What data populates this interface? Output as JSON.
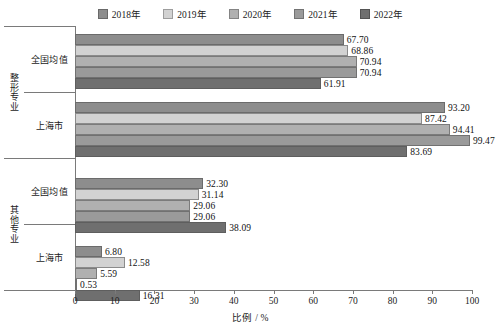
{
  "chart_data": {
    "type": "bar",
    "orientation": "horizontal",
    "title": "",
    "xlabel": "比例 / %",
    "ylabel": "",
    "xlim": [
      0,
      100
    ],
    "xticks": [
      0,
      10,
      20,
      30,
      40,
      50,
      60,
      70,
      80,
      90,
      100
    ],
    "grid": false,
    "legend_position": "top-center",
    "legend": [
      "2018年",
      "2019年",
      "2020年",
      "2021年",
      "2022年"
    ],
    "series_colors": [
      "#8d8d8d",
      "#d2d2d2",
      "#b0b0b0",
      "#9a9a9a",
      "#6f6f6f"
    ],
    "groups": [
      {
        "outer_label": "整形专业",
        "categories": [
          {
            "label": "全国均值",
            "values": [
              67.7,
              68.86,
              70.94,
              70.94,
              61.91
            ],
            "value_labels": [
              "67.70",
              "68.86",
              "70.94",
              "70.94",
              "61.91"
            ]
          },
          {
            "label": "上海市",
            "values": [
              93.2,
              87.42,
              94.41,
              99.47,
              83.69
            ],
            "value_labels": [
              "93.20",
              "87.42",
              "94.41",
              "99.47",
              "83.69"
            ]
          }
        ]
      },
      {
        "outer_label": "其他专业",
        "categories": [
          {
            "label": "全国均值",
            "values": [
              32.3,
              31.14,
              29.06,
              29.06,
              38.09
            ],
            "value_labels": [
              "32.30",
              "31.14",
              "29.06",
              "29.06",
              "38.09"
            ]
          },
          {
            "label": "上海市",
            "values": [
              6.8,
              12.58,
              5.59,
              0.53,
              16.31
            ],
            "value_labels": [
              "6.80",
              "12.58",
              "5.59",
              "0.53",
              "16.31"
            ]
          }
        ]
      }
    ]
  }
}
